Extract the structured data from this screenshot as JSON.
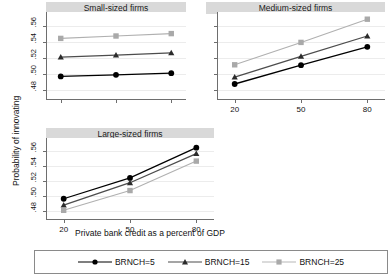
{
  "chart_data": {
    "type": "line",
    "title": "",
    "xlabel": "Private bank credit as a percent of GDP",
    "ylabel": "Probability of innovating",
    "x": [
      20,
      50,
      80
    ],
    "xlim": [
      12,
      88
    ],
    "ylim": [
      0.468,
      0.578
    ],
    "yticks": [
      0.48,
      0.5,
      0.52,
      0.54,
      0.56
    ],
    "ytick_labels": [
      ".48",
      ".50",
      ".52",
      ".54",
      ".56"
    ],
    "xtick_labels": [
      "20",
      "50",
      "80"
    ],
    "grid": "horizontal",
    "legend_position": "bottom",
    "panels": [
      {
        "title": "Small-sized firms",
        "series": [
          {
            "name": "BRNCH=5",
            "values": [
              0.4975,
              0.4995,
              0.5015
            ]
          },
          {
            "name": "BRNCH=15",
            "values": [
              0.5215,
              0.524,
              0.527
            ]
          },
          {
            "name": "BRNCH=25",
            "values": [
              0.545,
              0.548,
              0.551
            ]
          }
        ]
      },
      {
        "title": "Medium-sized firms",
        "series": [
          {
            "name": "BRNCH=5",
            "values": [
              0.488,
              0.5115,
              0.5345
            ]
          },
          {
            "name": "BRNCH=15",
            "values": [
              0.4965,
              0.5225,
              0.548
            ]
          },
          {
            "name": "BRNCH=25",
            "values": [
              0.512,
              0.54,
              0.569
            ]
          }
        ]
      },
      {
        "title": "Large-sized firms",
        "series": [
          {
            "name": "BRNCH=5",
            "values": [
              0.4965,
              0.5245,
              0.565
            ]
          },
          {
            "name": "BRNCH=15",
            "values": [
              0.488,
              0.518,
              0.557
            ]
          },
          {
            "name": "BRNCH=25",
            "values": [
              0.481,
              0.5075,
              0.547
            ]
          }
        ]
      }
    ],
    "legend": [
      {
        "label": "BRNCH=5",
        "color": "#000000",
        "marker": "circle"
      },
      {
        "label": "BRNCH=15",
        "color": "#4d4d4d",
        "marker": "triangle"
      },
      {
        "label": "BRNCH=25",
        "color": "#b0b0b0",
        "marker": "square"
      }
    ]
  }
}
